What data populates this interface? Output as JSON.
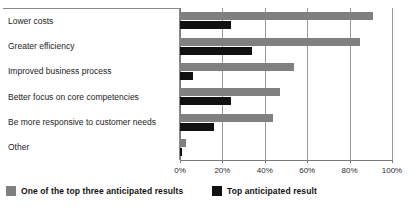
{
  "clipped_title": "",
  "legend": {
    "items": [
      {
        "label": "One of the top three anticipated results",
        "color": "#808080",
        "swatch_name": "legend-swatch-gray"
      },
      {
        "label": "Top anticipated result",
        "color": "#111111",
        "swatch_name": "legend-swatch-black"
      }
    ]
  },
  "chart_data": {
    "type": "bar",
    "orientation": "horizontal",
    "title": "",
    "xlabel": "",
    "ylabel": "",
    "xlim": [
      0,
      100
    ],
    "grid": true,
    "legend_position": "bottom",
    "tick_labels": [
      "0%",
      "20%",
      "40%",
      "60%",
      "80%",
      "100%"
    ],
    "tick_values": [
      0,
      20,
      40,
      60,
      80,
      100
    ],
    "categories": [
      "Lower costs",
      "Greater efficiency",
      "Improved business process",
      "Better focus on core competencies",
      "Be more responsive to customer needs",
      "Other"
    ],
    "series": [
      {
        "name": "One of the top three anticipated results",
        "color": "#808080",
        "values": [
          91,
          85,
          54,
          47,
          44,
          3
        ]
      },
      {
        "name": "Top anticipated result",
        "color": "#111111",
        "values": [
          24,
          34,
          6,
          24,
          16,
          1
        ]
      }
    ]
  }
}
